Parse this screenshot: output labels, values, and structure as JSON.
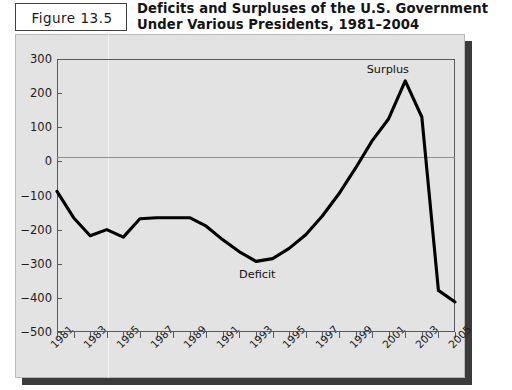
{
  "figure": {
    "label": "Figure 13.5",
    "title": "Deficits and Surpluses of the U.S. Government Under Various Presidents, 1981–2004"
  },
  "annotations": {
    "surplus": "Surplus",
    "deficit": "Deficit"
  },
  "colors": {
    "panel": "#e3e3e3",
    "line": "#000000",
    "axis": "#55585c",
    "zero_line": "#8d9095",
    "shadow": "#3b3b3b",
    "text": "#141414"
  },
  "chart_data": {
    "type": "line",
    "title": "Deficits and Surpluses of the U.S. Government Under Various Presidents, 1981–2004",
    "xlabel": "",
    "ylabel": "",
    "ylim": [
      -500,
      300
    ],
    "yticks": [
      300,
      200,
      100,
      0,
      -100,
      -200,
      -300,
      -400,
      -500
    ],
    "ytick_labels": [
      "300",
      "200",
      "100",
      "0",
      "−100",
      "−200",
      "−300",
      "−400",
      "−500"
    ],
    "xlim": [
      1981,
      2005
    ],
    "xticks": [
      1981,
      1983,
      1985,
      1987,
      1989,
      1991,
      1993,
      1995,
      1997,
      1999,
      2001,
      2003,
      2005
    ],
    "xtick_labels": [
      "1981",
      "1983",
      "1985",
      "1987",
      "1989",
      "1991",
      "1993",
      "1995",
      "1997",
      "1999",
      "2001",
      "2003",
      "2005"
    ],
    "minor_xticks": [
      1982,
      1984,
      1986,
      1988,
      1990,
      1992,
      1994,
      1996,
      1998,
      2000,
      2002,
      2004
    ],
    "grid": false,
    "legend": "none",
    "x": [
      1981,
      1982,
      1983,
      1984,
      1985,
      1986,
      1987,
      1988,
      1989,
      1990,
      1991,
      1992,
      1993,
      1994,
      1995,
      1996,
      1997,
      1998,
      1999,
      2000,
      2001,
      2002,
      2003,
      2004,
      2005
    ],
    "values": [
      -88,
      -165,
      -218,
      -200,
      -222,
      -168,
      -165,
      -165,
      -165,
      -190,
      -230,
      -265,
      -293,
      -285,
      -255,
      -215,
      -160,
      -95,
      -20,
      60,
      125,
      236,
      130,
      -378,
      -412
    ],
    "series": [
      {
        "name": "Federal budget deficit/surplus (billions of dollars)",
        "values": [
          -88,
          -165,
          -218,
          -200,
          -222,
          -168,
          -165,
          -165,
          -165,
          -190,
          -230,
          -265,
          -293,
          -285,
          -255,
          -215,
          -160,
          -95,
          -20,
          60,
          125,
          236,
          130,
          -378,
          -412
        ]
      }
    ],
    "annotations": [
      {
        "text": "Surplus",
        "x": 2001,
        "y": 236
      },
      {
        "text": "Deficit",
        "x": 1993,
        "y": -293
      }
    ]
  }
}
